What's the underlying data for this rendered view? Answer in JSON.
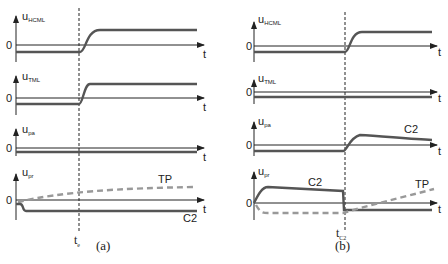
{
  "panels": [
    {
      "id": "a",
      "caption": "(a)",
      "event_label": "t",
      "event_sub": "e",
      "signals": [
        {
          "name": "u",
          "sub": "HCML",
          "zero": "0",
          "t": "t",
          "behavior": "negative level, rises to positive level after event"
        },
        {
          "name": "u",
          "sub": "TML",
          "zero": "0",
          "t": "t",
          "behavior": "negative level, rises to positive level after event"
        },
        {
          "name": "u",
          "sub": "pa",
          "zero": "0",
          "t": "t",
          "behavior": "constant slightly below zero"
        },
        {
          "name": "u",
          "sub": "pr",
          "zero": "0",
          "t": "t",
          "behavior": "C2 drops to negative constant; TP dashed rises slowly",
          "curve_labels": [
            "TP",
            "C2"
          ]
        }
      ]
    },
    {
      "id": "b",
      "caption": "(b)",
      "event_label": "t",
      "event_sub": "C2",
      "signals": [
        {
          "name": "u",
          "sub": "HCML",
          "zero": "0",
          "t": "t",
          "behavior": "negative level, rises to positive after event"
        },
        {
          "name": "u",
          "sub": "TML",
          "zero": "0",
          "t": "t",
          "behavior": "constant slightly below zero"
        },
        {
          "name": "u",
          "sub": "pa",
          "zero": "0",
          "t": "t",
          "behavior": "below zero, rises after event then slowly decays",
          "curve_labels": [
            "C2"
          ]
        },
        {
          "name": "u",
          "sub": "pr",
          "zero": "0",
          "t": "t",
          "behavior": "C2 rises then decays, drops negative at event; TP dashed negative then rises after event",
          "curve_labels": [
            "C2",
            "TP"
          ]
        }
      ]
    }
  ],
  "colors": {
    "signal": "#555555",
    "dashed": "#999999",
    "axis": "#222222"
  }
}
